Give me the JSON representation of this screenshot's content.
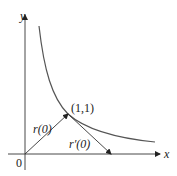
{
  "figure": {
    "axes": {
      "x_label": "x",
      "y_label": "y",
      "origin_label": "0"
    },
    "curve": {
      "equation": "y = 1/x",
      "point_label": "(1,1)"
    },
    "vectors": {
      "position_label": "r(0)",
      "tangent_label": "r′(0)"
    },
    "colors": {
      "ink": "#222222",
      "curve": "#555555"
    }
  }
}
